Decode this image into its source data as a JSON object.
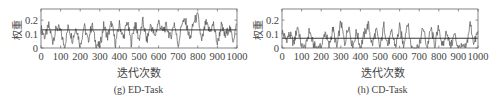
{
  "chart_data": [
    {
      "type": "line",
      "panel_id": "g",
      "caption": "(g) ED-Task",
      "title": "",
      "xlabel": "迭代次数",
      "ylabel": "权重",
      "xlim": [
        0,
        1000
      ],
      "ylim": [
        0,
        0.28
      ],
      "xticks": [
        0,
        100,
        200,
        300,
        400,
        500,
        600,
        700,
        800,
        900,
        1000
      ],
      "yticks": [
        0,
        0.1,
        0.2
      ],
      "ytick_labels": [
        "0",
        "0.1",
        "0.2"
      ],
      "xtick_labels": [
        "0",
        "100",
        "200",
        "300",
        "400",
        "500",
        "600",
        "700",
        "800",
        "900",
        "1000"
      ],
      "grid": false,
      "legend": null,
      "mean_line": 0.13,
      "series": [
        {
          "name": "weight",
          "x": [
            0,
            20,
            40,
            60,
            80,
            100,
            120,
            140,
            160,
            180,
            200,
            220,
            240,
            260,
            280,
            300,
            320,
            340,
            360,
            380,
            400,
            420,
            440,
            460,
            480,
            500,
            520,
            540,
            560,
            580,
            600,
            620,
            640,
            660,
            680,
            700,
            720,
            740,
            760,
            780,
            800,
            820,
            840,
            860,
            880,
            900,
            920,
            940,
            960,
            980,
            1000
          ],
          "values": [
            0.14,
            0.08,
            0.16,
            0.05,
            0.15,
            0.12,
            0.01,
            0.16,
            0.06,
            0.15,
            0.02,
            0.16,
            0.05,
            0.17,
            0.03,
            0.01,
            0.16,
            0.08,
            0.18,
            0.03,
            0.17,
            0.07,
            0.19,
            0.04,
            0.18,
            0.06,
            0.19,
            0.05,
            0.17,
            0.08,
            0.19,
            0.12,
            0.16,
            0.07,
            0.18,
            0.02,
            0.19,
            0.18,
            0.06,
            0.19,
            0.23,
            0.04,
            0.18,
            0.12,
            0.17,
            0.03,
            0.16,
            0.08,
            0.15,
            0.06,
            0.17
          ]
        }
      ]
    },
    {
      "type": "line",
      "panel_id": "h",
      "caption": "(h) CD-Task",
      "title": "",
      "xlabel": "迭代次数",
      "ylabel": "权重",
      "xlim": [
        0,
        1000
      ],
      "ylim": [
        0,
        0.28
      ],
      "xticks": [
        0,
        100,
        200,
        300,
        400,
        500,
        600,
        700,
        800,
        900,
        1000
      ],
      "yticks": [
        0,
        0.1,
        0.2
      ],
      "ytick_labels": [
        "0",
        "0.1",
        "0.2"
      ],
      "xtick_labels": [
        "0",
        "100",
        "200",
        "300",
        "400",
        "500",
        "600",
        "700",
        "800",
        "900",
        "1000"
      ],
      "grid": false,
      "legend": null,
      "mean_line": 0.07,
      "series": [
        {
          "name": "weight",
          "x": [
            0,
            20,
            40,
            60,
            80,
            100,
            120,
            140,
            160,
            180,
            200,
            220,
            240,
            260,
            280,
            300,
            320,
            340,
            360,
            380,
            400,
            420,
            440,
            460,
            480,
            500,
            520,
            540,
            560,
            580,
            600,
            620,
            640,
            660,
            680,
            700,
            720,
            740,
            760,
            780,
            800,
            820,
            840,
            860,
            880,
            900,
            920,
            940,
            960,
            980,
            1000
          ],
          "values": [
            0.12,
            0.06,
            0.1,
            0.03,
            0.16,
            0.01,
            0.0,
            0.13,
            0.02,
            0.0,
            0.0,
            0.12,
            0.01,
            0.14,
            0.0,
            0.19,
            0.03,
            0.17,
            0.0,
            0.12,
            0.0,
            0.1,
            0.17,
            0.02,
            0.13,
            0.0,
            0.16,
            0.02,
            0.11,
            0.01,
            0.15,
            0.02,
            0.19,
            0.0,
            0.0,
            0.01,
            0.15,
            0.0,
            0.14,
            0.02,
            0.15,
            0.0,
            0.13,
            0.0,
            0.1,
            0.0,
            0.0,
            0.0,
            0.18,
            0.03,
            0.12
          ]
        }
      ]
    }
  ]
}
